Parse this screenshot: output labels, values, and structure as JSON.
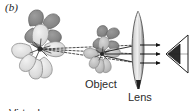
{
  "figure": {
    "panel_label": "(b)",
    "caption_virtual_line1": "Virtual",
    "caption_virtual_line2": "image",
    "caption_object": "Object",
    "caption_lens": "Lens",
    "background_color": "#ffffff",
    "ink_color": "#2b2b2b",
    "ray_color": "#1a1a1a"
  },
  "diagram": {
    "type": "ray-optics",
    "elements": [
      {
        "name": "virtual-image-flower",
        "label": "Virtual image",
        "x": 40,
        "y": 52,
        "size": "large",
        "shade": "light gray, faded"
      },
      {
        "name": "object-flower",
        "label": "Object",
        "x": 102,
        "y": 54,
        "size": "small",
        "shade": "medium gray"
      },
      {
        "name": "converging-lens",
        "label": "Lens",
        "x": 138,
        "y": 50,
        "shape": "biconvex",
        "height": 78
      },
      {
        "name": "eye",
        "label": "",
        "x": 172,
        "y": 54,
        "shape": "wedge"
      }
    ],
    "rays": {
      "real_ray_count": 3,
      "real_ray_style": "solid with arrowheads pointing right",
      "virtual_ray_count": 3,
      "virtual_ray_style": "dashed backward extensions converging at virtual image",
      "ray_y_positions": [
        45,
        54,
        63
      ]
    }
  }
}
